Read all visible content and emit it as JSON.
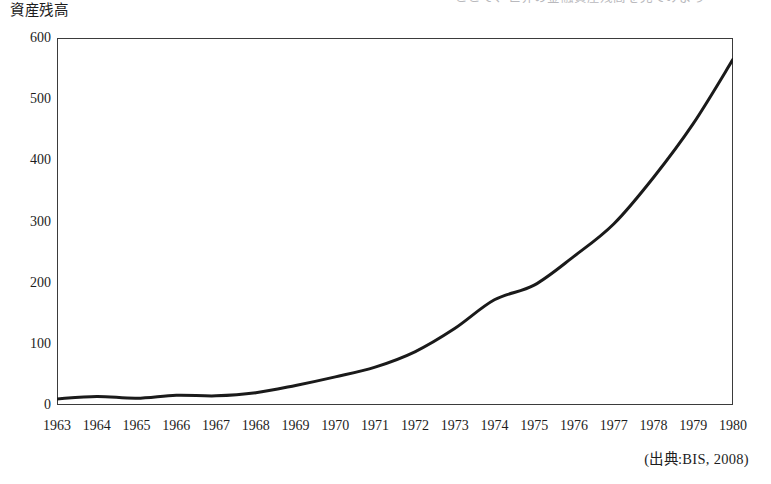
{
  "figure": {
    "y_axis_caption": "資産残高",
    "source_note": "(出典:BIS, 2008)",
    "cut_off_header_text": "ここで、世界の金融資産残高を見てみよう"
  },
  "chart_data": {
    "type": "line",
    "title": "",
    "subtitle": "",
    "xlabel": "",
    "ylabel": "資産残高",
    "xlim": [
      1963,
      1980
    ],
    "ylim": [
      0,
      600
    ],
    "grid": false,
    "legend_position": "none",
    "annotations": [
      "(出典:BIS, 2008)"
    ],
    "y_ticks": [
      0,
      100,
      200,
      300,
      400,
      500,
      600
    ],
    "y_tick_labels": [
      "0",
      "100",
      "200",
      "300",
      "400",
      "500",
      "600"
    ],
    "x_ticks": [
      1963,
      1964,
      1965,
      1966,
      1967,
      1968,
      1969,
      1970,
      1971,
      1972,
      1973,
      1974,
      1975,
      1976,
      1977,
      1978,
      1979,
      1980
    ],
    "x_tick_labels": [
      "1963",
      "1964",
      "1965",
      "1966",
      "1967",
      "1968",
      "1969",
      "1970",
      "1971",
      "1972",
      "1973",
      "1974",
      "1975",
      "1976",
      "1977",
      "1978",
      "1979",
      "1980"
    ],
    "categories": [
      1963,
      1964,
      1965,
      1966,
      1967,
      1968,
      1969,
      1970,
      1971,
      1972,
      1973,
      1974,
      1975,
      1976,
      1977,
      1978,
      1979,
      1980
    ],
    "series": [
      {
        "name": "資産残高",
        "color": "#1a1a1a",
        "line_width": 3,
        "values": [
          10,
          14,
          11,
          16,
          15,
          20,
          32,
          46,
          62,
          87,
          125,
          172,
          196,
          243,
          296,
          372,
          460,
          565
        ]
      }
    ]
  },
  "style": {
    "axis_color": "#3b3b3b",
    "line_color": "#1a1a1a",
    "background": "#ffffff",
    "tick_label_color": "#1d1d1d"
  }
}
